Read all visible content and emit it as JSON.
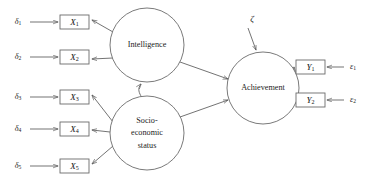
{
  "diagram": {
    "type": "structural-equation-model-path-diagram",
    "width": 373,
    "height": 188,
    "background_color": "#ffffff",
    "line_color": "#5a5a5a",
    "text_color": "#1d1d1d"
  },
  "latent_variables": [
    {
      "id": "intelligence",
      "label": "Intelligence",
      "label_lines": [
        "Intelligence"
      ],
      "shape": "circle",
      "cx": 147,
      "cy": 45,
      "r": 37
    },
    {
      "id": "ses",
      "label": "Socio-economic status",
      "label_lines": [
        "Socio-",
        "economic",
        "status"
      ],
      "shape": "circle",
      "cx": 147,
      "cy": 133,
      "r": 37
    },
    {
      "id": "achievement",
      "label": "Achievement",
      "label_lines": [
        "Achievement"
      ],
      "shape": "circle",
      "cx": 263,
      "cy": 88,
      "r": 36
    }
  ],
  "observed_variables": [
    {
      "id": "x1",
      "base": "X",
      "subscript": "1",
      "x": 60,
      "y": 15,
      "w": 29,
      "h": 14
    },
    {
      "id": "x2",
      "base": "X",
      "subscript": "2",
      "x": 60,
      "y": 50,
      "w": 29,
      "h": 14
    },
    {
      "id": "x3",
      "base": "X",
      "subscript": "3",
      "x": 60,
      "y": 90,
      "w": 29,
      "h": 14
    },
    {
      "id": "x4",
      "base": "X",
      "subscript": "4",
      "x": 60,
      "y": 122,
      "w": 29,
      "h": 14
    },
    {
      "id": "x5",
      "base": "X",
      "subscript": "5",
      "x": 60,
      "y": 159,
      "w": 29,
      "h": 14
    },
    {
      "id": "y1",
      "base": "Y",
      "subscript": "1",
      "x": 296,
      "y": 60,
      "w": 29,
      "h": 14
    },
    {
      "id": "y2",
      "base": "Y",
      "subscript": "2",
      "x": 296,
      "y": 93,
      "w": 29,
      "h": 14
    }
  ],
  "residuals": [
    {
      "id": "d1",
      "base": "δ",
      "subscript": "1",
      "x": 18,
      "y": 22,
      "target": "x1"
    },
    {
      "id": "d2",
      "base": "δ",
      "subscript": "2",
      "x": 18,
      "y": 57,
      "target": "x2"
    },
    {
      "id": "d3",
      "base": "δ",
      "subscript": "3",
      "x": 18,
      "y": 97,
      "target": "x3"
    },
    {
      "id": "d4",
      "base": "δ",
      "subscript": "4",
      "x": 18,
      "y": 129,
      "target": "x4"
    },
    {
      "id": "d5",
      "base": "δ",
      "subscript": "5",
      "x": 18,
      "y": 166,
      "target": "x5"
    },
    {
      "id": "e1",
      "base": "ε",
      "subscript": "1",
      "x": 353,
      "y": 67,
      "target": "y1"
    },
    {
      "id": "e2",
      "base": "ε",
      "subscript": "2",
      "x": 353,
      "y": 100,
      "target": "y2"
    }
  ],
  "disturbance": {
    "id": "zeta",
    "label": "ζ",
    "x": 252,
    "y": 20,
    "target": "achievement"
  },
  "paths": [
    {
      "from": "intelligence",
      "to": "x1",
      "kind": "directed"
    },
    {
      "from": "intelligence",
      "to": "x2",
      "kind": "directed"
    },
    {
      "from": "ses",
      "to": "x3",
      "kind": "directed"
    },
    {
      "from": "ses",
      "to": "x4",
      "kind": "directed"
    },
    {
      "from": "ses",
      "to": "x5",
      "kind": "directed"
    },
    {
      "from": "intelligence",
      "to": "achievement",
      "kind": "directed"
    },
    {
      "from": "ses",
      "to": "achievement",
      "kind": "directed"
    },
    {
      "from": "achievement",
      "to": "y1",
      "kind": "directed"
    },
    {
      "from": "achievement",
      "to": "y2",
      "kind": "directed"
    },
    {
      "from": "intelligence",
      "to": "ses",
      "kind": "covariance-curved-double-headed"
    }
  ]
}
